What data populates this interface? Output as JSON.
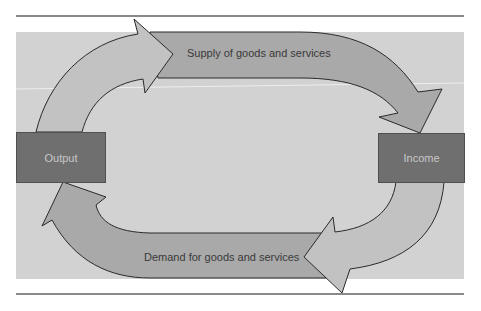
{
  "diagram": {
    "type": "circular-flow",
    "nodes": [
      {
        "id": "output",
        "label": "Output"
      },
      {
        "id": "income",
        "label": "Income"
      }
    ],
    "flows": [
      {
        "from": "output",
        "to": "income",
        "label": "Supply of goods and services",
        "position": "top"
      },
      {
        "from": "income",
        "to": "output",
        "label": "Demand for goods and services",
        "position": "bottom"
      }
    ],
    "colors": {
      "panel": "#d2d2d2",
      "box": "#6f6f6f",
      "band": "#a9a9a9",
      "arc": "#c2c2c2",
      "outline": "#2a2a2a",
      "rule": "#8a8a8a"
    }
  }
}
